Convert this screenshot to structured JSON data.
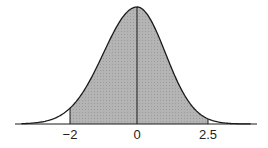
{
  "chart_data": {
    "type": "area",
    "title": "",
    "xlabel": "",
    "ylabel": "",
    "shaded_range": [
      -2,
      2.5
    ],
    "tick_labels": [
      "−2",
      "0",
      "2.5"
    ],
    "tick_values": [
      -2,
      0,
      2.5
    ],
    "grid": false,
    "colors": {
      "curve": "#1a1a1a",
      "fill": "#b0b0b0",
      "axis": "#1a1a1a"
    }
  },
  "labels": {
    "neg2": "−2",
    "zero": "0",
    "pos25": "2.5"
  }
}
